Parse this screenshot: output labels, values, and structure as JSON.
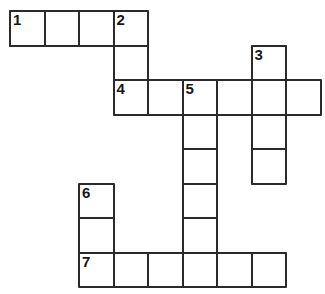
{
  "puzzle": {
    "title": "Crossword Puzzle Grid",
    "type": "crossword-grid",
    "background_color": "#ffffff",
    "cell_border_color": "#2a2a2a",
    "cell_fill_color": "#ffffff",
    "number_color": "#171717",
    "geometry": {
      "origin_x": 9,
      "origin_y": 10,
      "cell_size": 34.5,
      "border_width": 2,
      "columns": 9,
      "rows": 8,
      "image_width": 325,
      "image_height": 294
    },
    "numbers": [
      "1",
      "2",
      "3",
      "4",
      "5",
      "6",
      "7"
    ],
    "cells": [
      {
        "row": 0,
        "col": 0,
        "number": "1",
        "letter": ""
      },
      {
        "row": 0,
        "col": 1,
        "number": "",
        "letter": ""
      },
      {
        "row": 0,
        "col": 2,
        "number": "",
        "letter": ""
      },
      {
        "row": 0,
        "col": 3,
        "number": "2",
        "letter": ""
      },
      {
        "row": 1,
        "col": 3,
        "number": "",
        "letter": ""
      },
      {
        "row": 1,
        "col": 7,
        "number": "3",
        "letter": ""
      },
      {
        "row": 2,
        "col": 3,
        "number": "4",
        "letter": ""
      },
      {
        "row": 2,
        "col": 4,
        "number": "",
        "letter": ""
      },
      {
        "row": 2,
        "col": 5,
        "number": "5",
        "letter": ""
      },
      {
        "row": 2,
        "col": 6,
        "number": "",
        "letter": ""
      },
      {
        "row": 2,
        "col": 7,
        "number": "",
        "letter": ""
      },
      {
        "row": 2,
        "col": 8,
        "number": "",
        "letter": ""
      },
      {
        "row": 3,
        "col": 5,
        "number": "",
        "letter": ""
      },
      {
        "row": 3,
        "col": 7,
        "number": "",
        "letter": ""
      },
      {
        "row": 4,
        "col": 5,
        "number": "",
        "letter": ""
      },
      {
        "row": 4,
        "col": 7,
        "number": "",
        "letter": ""
      },
      {
        "row": 5,
        "col": 2,
        "number": "6",
        "letter": ""
      },
      {
        "row": 5,
        "col": 5,
        "number": "",
        "letter": ""
      },
      {
        "row": 6,
        "col": 2,
        "number": "",
        "letter": ""
      },
      {
        "row": 6,
        "col": 5,
        "number": "",
        "letter": ""
      },
      {
        "row": 7,
        "col": 2,
        "number": "7",
        "letter": ""
      },
      {
        "row": 7,
        "col": 3,
        "number": "",
        "letter": ""
      },
      {
        "row": 7,
        "col": 4,
        "number": "",
        "letter": ""
      },
      {
        "row": 7,
        "col": 5,
        "number": "",
        "letter": ""
      },
      {
        "row": 7,
        "col": 6,
        "number": "",
        "letter": ""
      },
      {
        "row": 7,
        "col": 7,
        "number": "",
        "letter": ""
      }
    ]
  }
}
